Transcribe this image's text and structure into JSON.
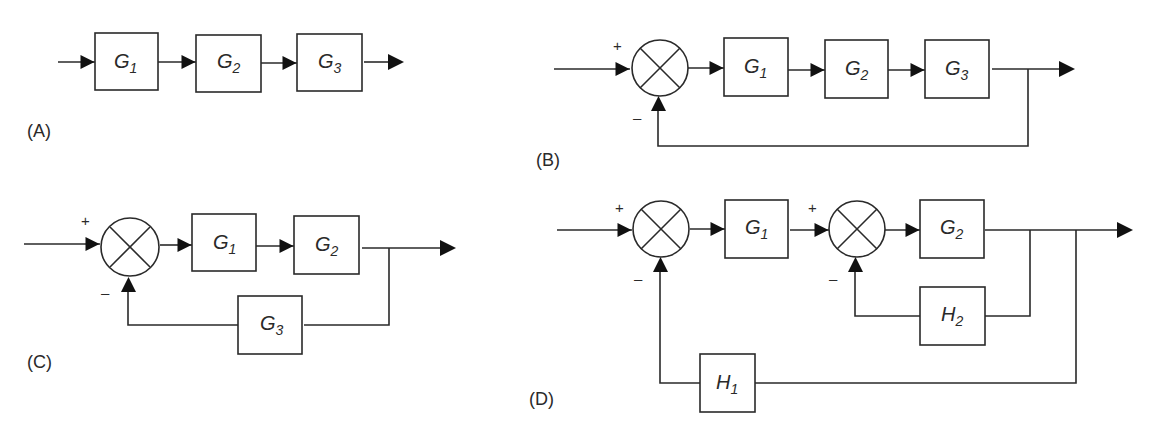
{
  "diagrams": {
    "A": {
      "tag": "(A)",
      "blocks": [
        {
          "name": "G",
          "sub": "1"
        },
        {
          "name": "G",
          "sub": "2"
        },
        {
          "name": "G",
          "sub": "3"
        }
      ]
    },
    "B": {
      "tag": "(B)",
      "sum_signs": {
        "plus": "+",
        "minus": "–"
      },
      "blocks": [
        {
          "name": "G",
          "sub": "1"
        },
        {
          "name": "G",
          "sub": "2"
        },
        {
          "name": "G",
          "sub": "3"
        }
      ]
    },
    "C": {
      "tag": "(C)",
      "sum_signs": {
        "plus": "+",
        "minus": "–"
      },
      "blocks": [
        {
          "name": "G",
          "sub": "1"
        },
        {
          "name": "G",
          "sub": "2"
        }
      ],
      "feedback": {
        "name": "G",
        "sub": "3"
      }
    },
    "D": {
      "tag": "(D)",
      "sum1_signs": {
        "plus": "+",
        "minus": "–"
      },
      "sum2_signs": {
        "plus": "+",
        "minus": "–"
      },
      "blocks": [
        {
          "name": "G",
          "sub": "1"
        },
        {
          "name": "G",
          "sub": "2"
        }
      ],
      "inner_feedback": {
        "name": "H",
        "sub": "2"
      },
      "outer_feedback": {
        "name": "H",
        "sub": "1"
      }
    }
  }
}
